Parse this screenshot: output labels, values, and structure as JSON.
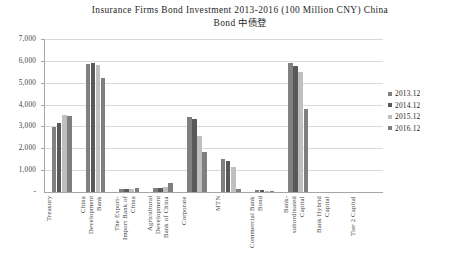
{
  "chart_data": {
    "type": "bar",
    "title": "Insurance Firms Bond Investment 2013-2016 (100 Million CNY) China Bond 中债登",
    "title_line1": "Insurance Firms Bond Investment 2013-2016 (100 Million CNY) China",
    "title_line2": "Bond 中债登",
    "xlabel": "",
    "ylabel": "",
    "ylim": [
      0,
      7000
    ],
    "grid": true,
    "legend_position": "right",
    "categories": [
      "Treasury",
      "China\nDevelopment\nBank",
      "The Export-\nImport Bank of\nChina",
      "Agricultural\nDevelopment\nBank of China",
      "Corporate",
      "MTN",
      "Commercial Bank\nBond",
      "Bank-\nsubordinated\nCapital",
      "Bank Hybrid\nCapital",
      "Tier 2 Capital"
    ],
    "yticks": [
      0,
      1000,
      2000,
      3000,
      4000,
      5000,
      6000,
      7000
    ],
    "ytick_labels": [
      "-",
      "1,000",
      "2,000",
      "3,000",
      "4,000",
      "5,000",
      "6,000",
      "7,000"
    ],
    "series": [
      {
        "name": "2013.12",
        "color": "#808080",
        "values": [
          2960,
          5860,
          120,
          170,
          3420,
          1500,
          95,
          5900,
          0,
          0
        ]
      },
      {
        "name": "2014.12",
        "color": "#595959",
        "values": [
          3140,
          5920,
          130,
          190,
          3320,
          1440,
          90,
          5760,
          0,
          0
        ]
      },
      {
        "name": "2015.12",
        "color": "#bfbfbf",
        "values": [
          3520,
          5800,
          135,
          215,
          2560,
          1150,
          65,
          5500,
          0,
          0
        ]
      },
      {
        "name": "2016.12",
        "color": "#7f7f7f",
        "values": [
          3480,
          5230,
          170,
          390,
          1840,
          120,
          40,
          3800,
          0,
          0
        ]
      }
    ]
  },
  "legend": {
    "items": [
      {
        "label": "2013.12",
        "color": "#808080"
      },
      {
        "label": "2014.12",
        "color": "#595959"
      },
      {
        "label": "2015.12",
        "color": "#bfbfbf"
      },
      {
        "label": "2016.12",
        "color": "#7f7f7f"
      }
    ]
  }
}
